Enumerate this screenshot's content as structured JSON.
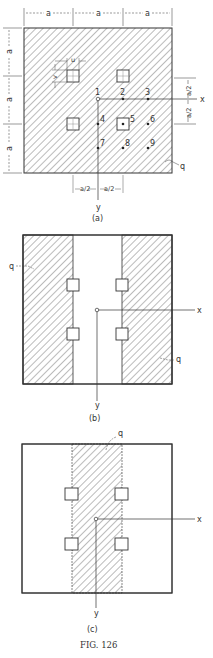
{
  "figure": {
    "caption": "FIG. 126",
    "panels": [
      {
        "id": "a",
        "label": "(a)",
        "load_label": "q",
        "axis_x": "x",
        "axis_y": "y",
        "dim_top": [
          "a",
          "a",
          "a"
        ],
        "dim_left": [
          "a",
          "a",
          "a"
        ],
        "dim_right": [
          "a/2",
          "a/2"
        ],
        "dim_bottom": [
          "a/2",
          "a/2"
        ],
        "column_dim_u": "u",
        "column_dim_v": "v",
        "points": [
          "1",
          "2",
          "3",
          "4",
          "5",
          "6",
          "7",
          "8",
          "9"
        ]
      },
      {
        "id": "b",
        "label": "(b)",
        "load_labels": [
          "q",
          "q"
        ],
        "axis_x": "x",
        "axis_y": "y"
      },
      {
        "id": "c",
        "label": "(c)",
        "load_label": "q",
        "axis_x": "x",
        "axis_y": "y"
      }
    ]
  }
}
